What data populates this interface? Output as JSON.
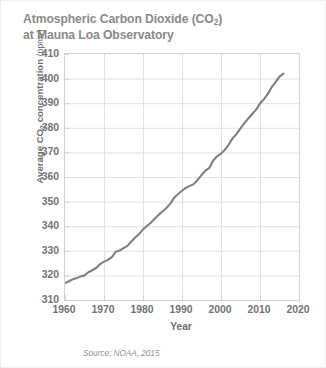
{
  "figure": {
    "title_line_1_a": "Atmospheric Carbon Dioxide (CO",
    "title_line_1_sub": "2",
    "title_line_1_b": ")",
    "title_line_2": "at Mauna Loa Observatory",
    "source_note": "Source: NOAA, 2015",
    "ylabel_main_a": "Average CO",
    "ylabel_sub": "2",
    "ylabel_main_b": " concentration ",
    "ylabel_unit": "(ppmv)",
    "xlabel": "Year",
    "line_color": "#808080",
    "grid_color": "#e3e3e3",
    "frame_color": "#d2d2d2",
    "text_color": "#737373",
    "title_color": "#8a8a8a"
  },
  "chart_data": {
    "type": "line",
    "title": "Atmospheric Carbon Dioxide (CO2) at Mauna Loa Observatory",
    "subtitle": "",
    "xlabel": "Year",
    "ylabel": "Average CO2 concentration (ppmv)",
    "source": "Source: NOAA, 2015",
    "xlim": [
      1960,
      2020
    ],
    "ylim": [
      310,
      410
    ],
    "xticks": [
      1960,
      1970,
      1980,
      1990,
      2000,
      2010,
      2020
    ],
    "yticks": [
      310,
      320,
      330,
      340,
      350,
      360,
      370,
      380,
      390,
      400,
      410
    ],
    "grid": true,
    "legend": "none",
    "series": [
      {
        "name": "Average CO2 concentration",
        "color": "#808080",
        "x": [
          1959,
          1960,
          1961,
          1962,
          1963,
          1964,
          1965,
          1966,
          1967,
          1968,
          1969,
          1970,
          1971,
          1972,
          1973,
          1974,
          1975,
          1976,
          1977,
          1978,
          1979,
          1980,
          1981,
          1982,
          1983,
          1984,
          1985,
          1986,
          1987,
          1988,
          1989,
          1990,
          1991,
          1992,
          1993,
          1994,
          1995,
          1996,
          1997,
          1998,
          1999,
          2000,
          2001,
          2002,
          2003,
          2004,
          2005,
          2006,
          2007,
          2008,
          2009,
          2010,
          2011,
          2012,
          2013,
          2014,
          2015,
          2016
        ],
        "y": [
          315.9,
          316.9,
          317.6,
          318.4,
          318.9,
          319.6,
          320.0,
          321.3,
          322.1,
          323.0,
          324.6,
          325.6,
          326.3,
          327.4,
          329.6,
          330.1,
          331.1,
          332.0,
          333.8,
          335.4,
          336.8,
          338.7,
          340.1,
          341.4,
          343.0,
          344.6,
          346.0,
          347.4,
          349.2,
          351.6,
          353.1,
          354.4,
          355.6,
          356.4,
          357.1,
          358.8,
          360.8,
          362.6,
          363.7,
          366.7,
          368.4,
          369.5,
          371.1,
          373.2,
          375.8,
          377.5,
          379.8,
          381.9,
          383.8,
          385.6,
          387.4,
          389.9,
          391.6,
          393.8,
          396.5,
          398.6,
          400.8,
          402.0
        ]
      }
    ]
  }
}
